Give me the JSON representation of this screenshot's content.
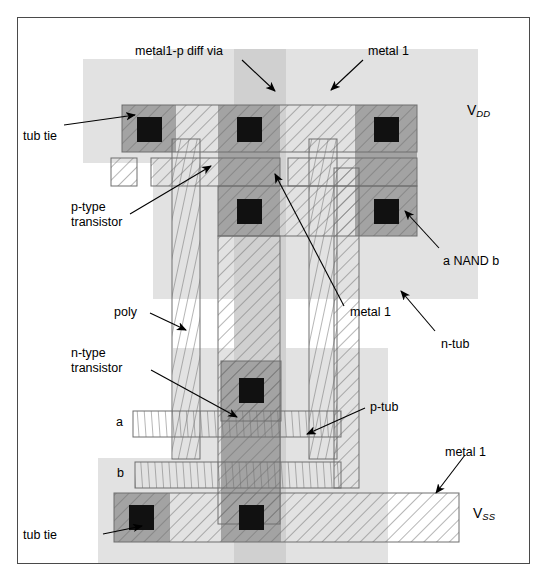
{
  "figure": {
    "kind": "cmos-layout-diagram",
    "title_text": "a NAND b",
    "colors": {
      "tub_light": "#e2e2e2",
      "tub_dark": "#d0d0d0",
      "diffusion": "#a3a3a3",
      "contact_cut": "#111111",
      "outline": "#6e6e6e",
      "frame": "#4a4a4a",
      "background": "#ffffff"
    }
  },
  "labels": {
    "metal1_p_diff_via": "metal1-p diff via",
    "metal_1_top": "metal 1",
    "tub_tie_top": "tub tie",
    "p_type_transistor_l1": "p-type",
    "p_type_transistor_l2": "transistor",
    "vdd_v": "V",
    "vdd_sub": "DD",
    "a_nand_b": "a NAND b",
    "poly": "poly",
    "n_type_transistor_l1": "n-type",
    "n_type_transistor_l2": "transistor",
    "metal_1_mid": "metal 1",
    "n_tub": "n-tub",
    "p_tub": "p-tub",
    "metal_1_bottom": "metal 1",
    "input_a": "a",
    "input_b": "b",
    "vss_v": "V",
    "vss_sub": "SS",
    "tub_tie_bottom": "tub tie"
  },
  "layers": {
    "n_tub_name": "n-tub-region",
    "p_tub_name": "p-tub-region",
    "p_diffusion_name": "p-diffusion",
    "n_diffusion_name": "n-diffusion",
    "metal1_name": "metal1-wire",
    "poly_name": "polysilicon-wire",
    "contact_name": "contact-cut"
  }
}
